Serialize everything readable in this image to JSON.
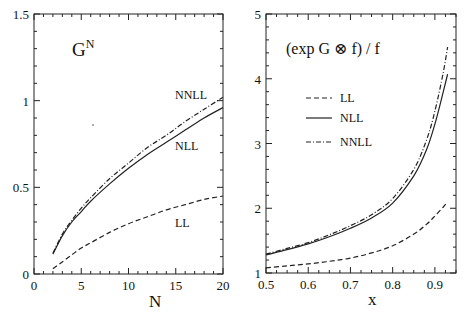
{
  "chart_data": [
    {
      "type": "line",
      "title": "",
      "annotation": "G^N",
      "xlabel": "N",
      "ylabel": "",
      "xlim": [
        0,
        20
      ],
      "ylim": [
        0,
        1.5
      ],
      "xticks": [
        "0",
        "5",
        "10",
        "15",
        "20"
      ],
      "yticks": [
        "0",
        "0.5",
        "1",
        "1.5"
      ],
      "grid": false,
      "legend": "inline labels",
      "curve_labels": [
        "NNLL",
        "NLL",
        "LL"
      ],
      "x": [
        2,
        3,
        4,
        5,
        6,
        8,
        10,
        12,
        14,
        16,
        18,
        20
      ],
      "series": [
        {
          "name": "LL",
          "style": "dashed",
          "values": [
            0.03,
            0.07,
            0.11,
            0.15,
            0.18,
            0.24,
            0.29,
            0.33,
            0.37,
            0.4,
            0.43,
            0.45
          ]
        },
        {
          "name": "NLL",
          "style": "solid",
          "values": [
            0.115,
            0.22,
            0.3,
            0.36,
            0.42,
            0.52,
            0.61,
            0.69,
            0.76,
            0.83,
            0.9,
            0.96
          ]
        },
        {
          "name": "NNLL",
          "style": "dash-dot",
          "values": [
            0.12,
            0.23,
            0.31,
            0.38,
            0.44,
            0.55,
            0.64,
            0.73,
            0.8,
            0.88,
            0.95,
            1.02
          ]
        }
      ]
    },
    {
      "type": "line",
      "title": "",
      "annotation": "(exp G ⊗ f) / f",
      "xlabel": "x",
      "ylabel": "",
      "xlim": [
        0.5,
        0.95
      ],
      "ylim": [
        1,
        5
      ],
      "xticks": [
        "0.5",
        "0.6",
        "0.7",
        "0.8",
        "0.9"
      ],
      "yticks": [
        "1",
        "2",
        "3",
        "4",
        "5"
      ],
      "grid": false,
      "legend": "upper left",
      "legend_entries": [
        "LL",
        "NLL",
        "NNLL"
      ],
      "x": [
        0.5,
        0.55,
        0.6,
        0.65,
        0.7,
        0.75,
        0.8,
        0.85,
        0.88,
        0.9,
        0.92,
        0.93
      ],
      "series": [
        {
          "name": "LL",
          "style": "dashed",
          "values": [
            1.08,
            1.11,
            1.14,
            1.18,
            1.23,
            1.31,
            1.42,
            1.6,
            1.75,
            1.88,
            2.02,
            2.1
          ]
        },
        {
          "name": "NLL",
          "style": "solid",
          "values": [
            1.28,
            1.36,
            1.45,
            1.56,
            1.69,
            1.85,
            2.08,
            2.5,
            2.9,
            3.3,
            3.8,
            4.07
          ]
        },
        {
          "name": "NNLL",
          "style": "dash-dot",
          "values": [
            1.29,
            1.38,
            1.47,
            1.59,
            1.73,
            1.9,
            2.15,
            2.6,
            3.05,
            3.5,
            4.1,
            4.49
          ]
        }
      ]
    }
  ]
}
